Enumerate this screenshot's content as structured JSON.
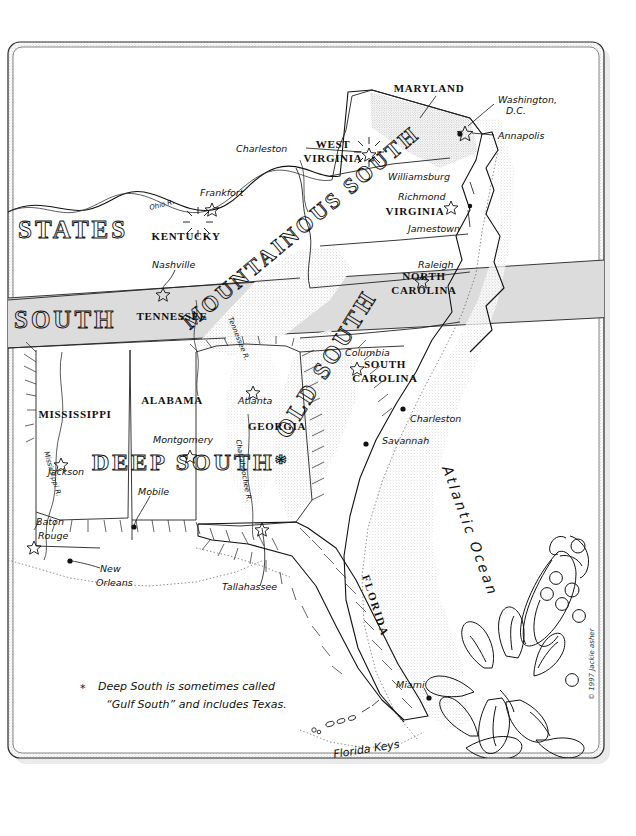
{
  "map": {
    "title_absent": true,
    "copyright": "© 1997 Jackie asher",
    "footnote": {
      "marker": "*",
      "line1": "Deep South is sometimes called",
      "line2": "“Gulf South” and includes Texas."
    },
    "ocean_label": "Atlantic Ocean",
    "frame": {
      "style": "rounded-rectangle-stippled",
      "border_color": "#333333",
      "shadow_color": "#cccccc"
    },
    "colors": {
      "ink": "#111111",
      "paper": "#ffffff",
      "shaded_band": "#d9d9d9",
      "stipple": "#bbbbbb"
    },
    "regions": [
      {
        "id": "states",
        "label": "STATES",
        "style": "outline-caps"
      },
      {
        "id": "south-band",
        "label": "SOUTH",
        "style": "outline-caps"
      },
      {
        "id": "mountainous-south",
        "label": "MOUNTAINOUS SOUTH",
        "style": "outline-caps-diagonal"
      },
      {
        "id": "old-south",
        "label": "OLD SOUTH",
        "style": "outline-caps-diagonal"
      },
      {
        "id": "deep-south",
        "label": "DEEP SOUTH*",
        "style": "outline-caps"
      }
    ],
    "states": [
      {
        "name": "MARYLAND",
        "x": 429,
        "y": 92
      },
      {
        "name": "WEST\nVIRGINIA",
        "x": 333,
        "y": 152
      },
      {
        "name": "KENTUCKY",
        "x": 186,
        "y": 240
      },
      {
        "name": "VIRGINIA",
        "x": 415,
        "y": 215
      },
      {
        "name": "TENNESSEE",
        "x": 172,
        "y": 320
      },
      {
        "name": "NORTH\nCAROLINA",
        "x": 424,
        "y": 283
      },
      {
        "name": "SOUTH\nCAROLINA",
        "x": 385,
        "y": 371
      },
      {
        "name": "GEORGIA",
        "x": 277,
        "y": 430
      },
      {
        "name": "ALABAMA",
        "x": 172,
        "y": 404
      },
      {
        "name": "MISSISSIPPI",
        "x": 75,
        "y": 418
      },
      {
        "name": "FLORIDA",
        "x": 372,
        "y": 607
      }
    ],
    "cities": [
      {
        "name": "Washington,\nD.C.",
        "marker": "star",
        "label_x": 527,
        "label_y": 102,
        "dot_x": 465,
        "dot_y": 133
      },
      {
        "name": "Annapolis",
        "marker": "star",
        "label_x": 527,
        "label_y": 136,
        "dot_x": 469,
        "dot_y": 131
      },
      {
        "name": "Charleston",
        "marker": "star",
        "label_x": 263,
        "label_y": 150,
        "dot_x": 369,
        "dot_y": 151
      },
      {
        "name": "Frankfort",
        "marker": "star",
        "label_x": 224,
        "label_y": 194,
        "dot_x": 212,
        "dot_y": 205
      },
      {
        "name": "Williamsburg",
        "marker": "none",
        "label_x": 430,
        "label_y": 178,
        "dot_x": 470,
        "dot_y": 190
      },
      {
        "name": "Richmond",
        "marker": "star",
        "label_x": 422,
        "label_y": 198,
        "dot_x": 451,
        "dot_y": 203
      },
      {
        "name": "Jamestown",
        "marker": "none",
        "label_x": 443,
        "label_y": 231,
        "dot_x": 468,
        "dot_y": 213
      },
      {
        "name": "Nashville",
        "marker": "star",
        "label_x": 180,
        "label_y": 265,
        "dot_x": 163,
        "dot_y": 290
      },
      {
        "name": "Raleigh",
        "marker": "star",
        "label_x": 438,
        "label_y": 265,
        "dot_x": 422,
        "dot_y": 277
      },
      {
        "name": "Columbia",
        "marker": "star",
        "label_x": 365,
        "label_y": 352,
        "dot_x": 357,
        "dot_y": 364
      },
      {
        "name": "Charleston",
        "marker": "dot",
        "label_x": 412,
        "label_y": 418,
        "dot_x": 403,
        "dot_y": 409
      },
      {
        "name": "Savannah",
        "marker": "dot",
        "label_x": 388,
        "label_y": 440,
        "dot_x": 366,
        "dot_y": 444
      },
      {
        "name": "Atlanta",
        "marker": "star",
        "label_x": 248,
        "label_y": 400,
        "dot_x": 253,
        "dot_y": 388
      },
      {
        "name": "Montgomery",
        "marker": "star",
        "label_x": 183,
        "label_y": 440,
        "dot_x": 190,
        "dot_y": 452
      },
      {
        "name": "Jackson",
        "marker": "star",
        "label_x": 68,
        "label_y": 472,
        "dot_x": 61,
        "dot_y": 460
      },
      {
        "name": "Mobile",
        "marker": "dot",
        "label_x": 152,
        "label_y": 493,
        "dot_x": 134,
        "dot_y": 527
      },
      {
        "name": "Baton\nRouge",
        "marker": "star",
        "label_x": 36,
        "label_y": 523,
        "dot_x": 34,
        "dot_y": 543
      },
      {
        "name": "New\nOrleans",
        "marker": "dot",
        "label_x": 102,
        "label_y": 570,
        "dot_x": 70,
        "dot_y": 561
      },
      {
        "name": "Tallahassee",
        "marker": "star",
        "label_x": 225,
        "label_y": 588,
        "dot_x": 262,
        "dot_y": 525
      },
      {
        "name": "Miami",
        "marker": "dot",
        "label_x": 398,
        "label_y": 685,
        "dot_x": 429,
        "dot_y": 698
      }
    ],
    "features": [
      {
        "name": "Ohio R.",
        "type": "river"
      },
      {
        "name": "Tennessee R.",
        "type": "river"
      },
      {
        "name": "Mississippi R.",
        "type": "river"
      },
      {
        "name": "Chattahoochee R.",
        "type": "river"
      },
      {
        "name": "Florida Keys",
        "type": "islands"
      },
      {
        "name": "Atlantic Ocean",
        "type": "ocean"
      }
    ],
    "illustrations": [
      {
        "name": "pea-pod-illustration"
      },
      {
        "name": "magnolia-flower-illustration"
      }
    ]
  }
}
